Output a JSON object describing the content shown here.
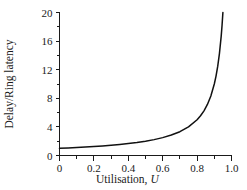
{
  "chart_data": {
    "type": "line",
    "title": "",
    "xlabel": "Utilisation, U",
    "xlabel_text": "Utilisation,",
    "xlabel_symbol": "U",
    "ylabel": "Delay/Ring latency",
    "xlim": [
      0,
      1.0
    ],
    "ylim": [
      0,
      20
    ],
    "grid": false,
    "legend": null,
    "xticks": [
      0,
      0.2,
      0.4,
      0.6,
      0.8,
      1.0
    ],
    "xtick_labels": [
      "0",
      "0.2",
      "0.4",
      "0.6",
      "0.8",
      "1.0"
    ],
    "xminor_ticks": [
      0.1,
      0.3,
      0.5,
      0.7,
      0.9
    ],
    "yticks": [
      0,
      4,
      8,
      12,
      16,
      20
    ],
    "ytick_labels": [
      "0",
      "4",
      "8",
      "12",
      "16",
      "20"
    ],
    "yminor_ticks": [
      2,
      6,
      10,
      14,
      18
    ],
    "series": [
      {
        "name": "Delay/Ring latency vs Utilisation",
        "formula": "1/(1-U)",
        "color": "#111111",
        "x": [
          0.0,
          0.05,
          0.1,
          0.15,
          0.2,
          0.25,
          0.3,
          0.35,
          0.4,
          0.45,
          0.5,
          0.55,
          0.6,
          0.65,
          0.7,
          0.75,
          0.8,
          0.82,
          0.84,
          0.86,
          0.88,
          0.9,
          0.91,
          0.92,
          0.93,
          0.94,
          0.945,
          0.95
        ],
        "y": [
          1.0,
          1.05,
          1.11,
          1.18,
          1.25,
          1.33,
          1.43,
          1.54,
          1.67,
          1.82,
          2.0,
          2.22,
          2.5,
          2.86,
          3.33,
          4.0,
          5.0,
          5.56,
          6.25,
          7.14,
          8.33,
          10.0,
          11.11,
          12.5,
          14.29,
          16.67,
          18.18,
          20.0
        ]
      }
    ]
  },
  "colors": {
    "curve": "#111111",
    "axis": "#1a1a1a",
    "background": "#ffffff"
  }
}
